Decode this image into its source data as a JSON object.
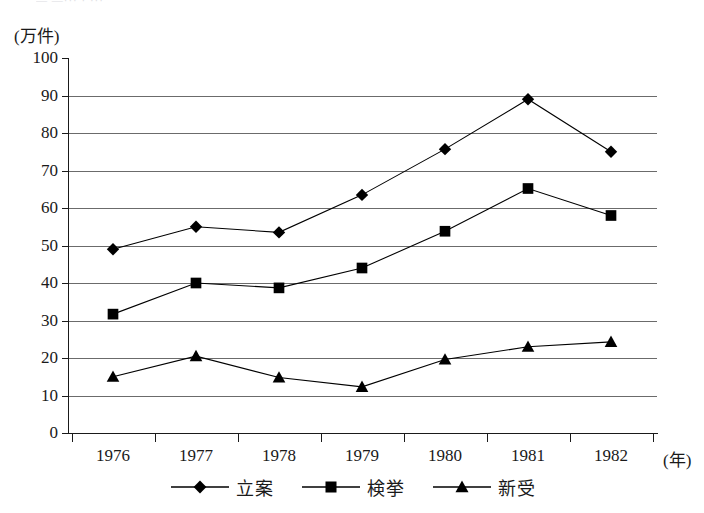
{
  "top_remnant": "— —··· · ···",
  "axes": {
    "y_unit_label": "(万件)",
    "x_unit_label": "(年)",
    "y_ticks": [
      "100",
      "90",
      "80",
      "70",
      "60",
      "50",
      "40",
      "30",
      "20",
      "10",
      "0"
    ],
    "x_ticks": [
      "1976",
      "1977",
      "1978",
      "1979",
      "1980",
      "1981",
      "1982"
    ]
  },
  "chart_data": {
    "type": "line",
    "title": "",
    "xlabel": "(年)",
    "ylabel": "(万件)",
    "ylim": [
      0,
      100
    ],
    "ytick_step": 10,
    "grid": true,
    "legend_position": "bottom-center",
    "categories": [
      "1976",
      "1977",
      "1978",
      "1979",
      "1980",
      "1981",
      "1982"
    ],
    "series": [
      {
        "name": "立案",
        "marker": "diamond",
        "color": "#000000",
        "values": [
          49.0,
          55.0,
          53.5,
          63.5,
          75.7,
          89.0,
          75.0
        ]
      },
      {
        "name": "検挙",
        "marker": "square",
        "color": "#000000",
        "values": [
          31.7,
          40.0,
          38.7,
          44.0,
          53.8,
          65.2,
          58.0
        ]
      },
      {
        "name": "新受",
        "marker": "triangle",
        "color": "#000000",
        "values": [
          15.0,
          20.5,
          14.8,
          12.3,
          19.6,
          23.0,
          24.3
        ]
      }
    ]
  },
  "legend": {
    "items": [
      {
        "label": "立案",
        "marker": "diamond"
      },
      {
        "label": "検挙",
        "marker": "square"
      },
      {
        "label": "新受",
        "marker": "triangle"
      }
    ]
  }
}
